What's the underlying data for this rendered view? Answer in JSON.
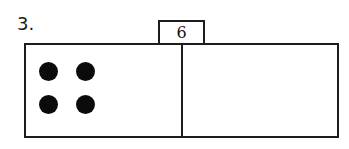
{
  "worksheet": {
    "problem_number": "3.",
    "background_color": "#ffffff",
    "ink_color": "#1d1d1d"
  },
  "bar_model": {
    "total_tag": {
      "value": "6",
      "icon": "total-bracket"
    },
    "parts": [
      {
        "name": "left-part",
        "counter_count": 4,
        "counters": [
          {
            "row": 0,
            "col": 0
          },
          {
            "row": 0,
            "col": 1
          },
          {
            "row": 1,
            "col": 0
          },
          {
            "row": 1,
            "col": 1
          }
        ],
        "counter_color": "#0b0b0b"
      },
      {
        "name": "right-part",
        "counter_count": 0,
        "counters": [],
        "counter_color": "#0b0b0b"
      }
    ]
  }
}
